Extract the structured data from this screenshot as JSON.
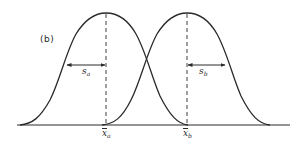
{
  "figure": {
    "panel_label": "(b)",
    "colors": {
      "stroke": "#2a2a2a",
      "background": "#ffffff"
    },
    "curves": [
      {
        "name": "distribution-a",
        "mean_label": "x",
        "mean_subscript": "a",
        "sd_label": "s",
        "sd_subscript": "a",
        "mean_x_px": 106,
        "sd_arrow_direction": "left"
      },
      {
        "name": "distribution-b",
        "mean_label": "x",
        "mean_subscript": "b",
        "sd_label": "s",
        "sd_subscript": "b",
        "mean_x_px": 187,
        "sd_arrow_direction": "right"
      }
    ]
  }
}
